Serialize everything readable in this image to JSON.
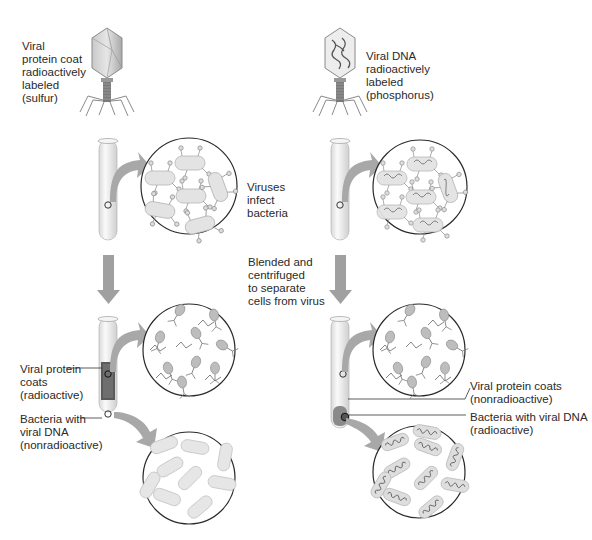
{
  "left_column": {
    "phage_label": "Viral\nprotein coat\nradioactively\nlabeled\n(sulfur)",
    "pellet_protein_label": "Viral protein\ncoats\n(radioactive)",
    "pellet_bacteria_label": "Bacteria with\nviral DNA\n(nonradioactive)"
  },
  "right_column": {
    "phage_label": "Viral DNA\nradioactively\nlabeled\n(phosphorus)",
    "supernatant_label": "Viral protein coats\n(nonradioactive)",
    "pellet_label": "Bacteria with viral DNA\n(radioactive)"
  },
  "center": {
    "step1_label": "Viruses\ninfect\nbacteria",
    "step2_label": "Blended and\ncentrifuged\nto separate\ncells from virus"
  },
  "colors": {
    "arrow": "#9a9a9a",
    "circle_stroke": "#2a2a2a",
    "tube_fill": "#eeeeee",
    "bacteria_fill": "#e4e4e4",
    "virus_fill": "#b4b4b4"
  }
}
